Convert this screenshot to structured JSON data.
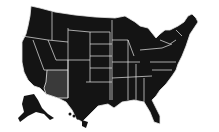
{
  "map": {
    "title": "",
    "subject": "United States map",
    "highlighted_state": "Arizona",
    "colors": {
      "background": "#ffffff",
      "state_fill": "#141414",
      "highlight_fill": "#3a3a3a",
      "border": "#e8e8e8"
    }
  }
}
